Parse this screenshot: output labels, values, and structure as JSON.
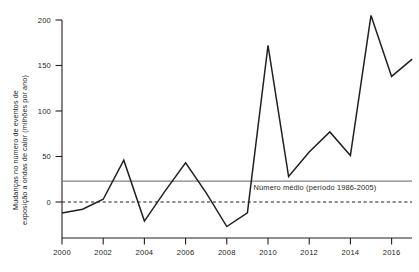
{
  "chart_data": {
    "type": "line",
    "title": "",
    "xlabel": "",
    "ylabel": "Mudanças no número de eventos de exposição a ondas de calor (milhões por ano)",
    "ylabel_line1": "Mudanças no número de eventos de",
    "ylabel_line2": "exposição a ondas de calor (milhões por ano)",
    "xlim": [
      2000,
      2017
    ],
    "ylim": [
      -35,
      210
    ],
    "yticks": [
      0,
      50,
      100,
      150,
      200
    ],
    "ytick_labels": [
      "0",
      "50",
      "100",
      "150",
      "200"
    ],
    "xticks": [
      2000,
      2002,
      2004,
      2006,
      2008,
      2010,
      2012,
      2014,
      2016
    ],
    "xtick_labels": [
      "2000",
      "2002",
      "2004",
      "2006",
      "2008",
      "2010",
      "2012",
      "2014",
      "2016"
    ],
    "grid": false,
    "legend": "none",
    "x": [
      2000,
      2001,
      2002,
      2003,
      2004,
      2005,
      2006,
      2007,
      2008,
      2009,
      2010,
      2011,
      2012,
      2013,
      2014,
      2015,
      2016,
      2017
    ],
    "values": [
      -12,
      -8,
      3,
      46,
      -21,
      12,
      43,
      10,
      -27,
      -12,
      172,
      28,
      55,
      77,
      51,
      205,
      138,
      157
    ],
    "series": [
      {
        "name": "Mudanças no número de eventos de exposição a ondas de calor",
        "color": "#231f20",
        "style": "solid",
        "values": [
          -12,
          -8,
          3,
          46,
          -21,
          12,
          43,
          10,
          -27,
          -12,
          172,
          28,
          55,
          77,
          51,
          205,
          138,
          157
        ]
      }
    ],
    "reference_lines": [
      {
        "name": "media-1986-2005",
        "label": "Número médio (período 1986-2005)",
        "value": 23,
        "color": "#808285",
        "style": "solid"
      },
      {
        "name": "zero-baseline",
        "label": "",
        "value": 0,
        "color": "#231f20",
        "style": "dashed"
      }
    ],
    "annotations": [
      {
        "text": "Número médio (período 1986-2005)",
        "x": 2009.3,
        "y": 16
      }
    ]
  }
}
